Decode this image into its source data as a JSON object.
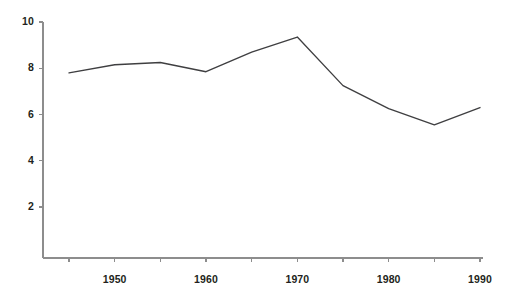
{
  "chart_data": {
    "type": "line",
    "title": "",
    "subtitle": "",
    "xlabel": "",
    "ylabel": "",
    "x": [
      1945,
      1950,
      1955,
      1960,
      1965,
      1970,
      1975,
      1980,
      1985,
      1990
    ],
    "values": [
      7.8,
      8.15,
      8.25,
      7.85,
      8.7,
      9.35,
      7.25,
      6.25,
      5.55,
      6.3
    ],
    "series": [
      {
        "name": "",
        "values": [
          7.8,
          8.15,
          8.25,
          7.85,
          8.7,
          9.35,
          7.25,
          6.25,
          5.55,
          6.3
        ]
      }
    ],
    "xlim": [
      1944,
      1991
    ],
    "ylim": [
      0,
      10
    ],
    "x_ticks": [
      1945,
      1950,
      1955,
      1960,
      1965,
      1970,
      1975,
      1980,
      1985,
      1990
    ],
    "x_tick_labels": [
      "",
      "1950",
      "",
      "1960",
      "",
      "1970",
      "",
      "1980",
      "",
      "1990"
    ],
    "y_ticks": [
      2,
      4,
      6,
      8,
      10
    ],
    "y_tick_labels": [
      "2",
      "4",
      "6",
      "8",
      "10"
    ],
    "grid": false,
    "legend": false,
    "legend_position": "none",
    "line_color": "#3f3f41",
    "axis_color": "#8d8d8d",
    "text_color": "#231f20",
    "background_color": "#ffffff",
    "annotations": []
  },
  "axes": {
    "y_axis_name": "value-axis",
    "x_axis_name": "year-axis"
  }
}
